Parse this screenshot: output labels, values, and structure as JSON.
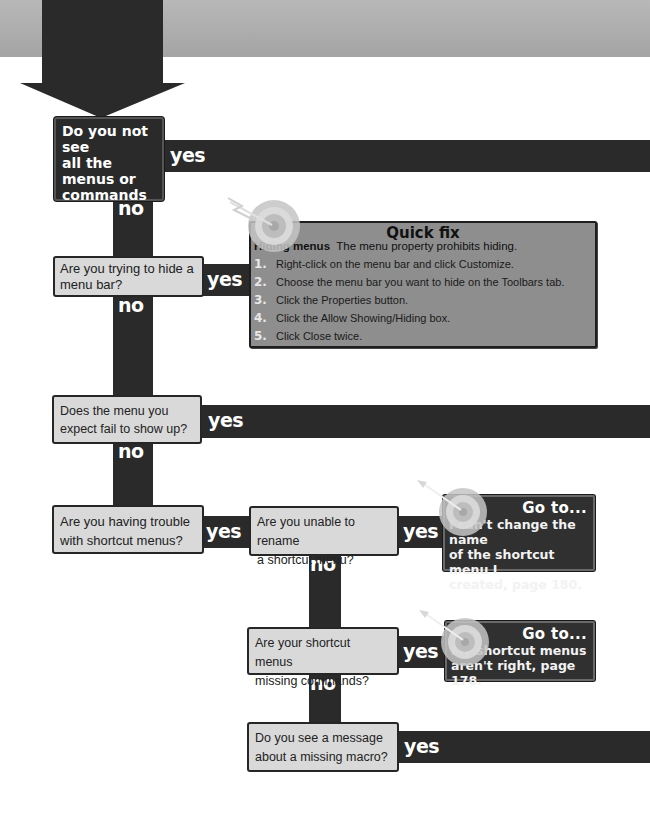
{
  "header": {
    "band_color": "#adadad"
  },
  "colors": {
    "dark": "#2a2a2a",
    "question_box": "#d9d9d9",
    "quick_fix_box": "#8e8e8e",
    "goto_box": "#303030",
    "text_light": "#ffffff"
  },
  "labels": {
    "yes": "yes",
    "no": "no"
  },
  "questions": [
    {
      "id": "q1",
      "text": "Do you not see all the menus or commands you need?",
      "lines": [
        "Do you not see",
        "all the menus or",
        "commands you",
        "need?"
      ],
      "style": "dark"
    },
    {
      "id": "q2",
      "text": "Are you trying to hide a menu bar?",
      "lines": [
        "Are you trying to hide a",
        "menu bar?"
      ],
      "style": "light"
    },
    {
      "id": "q3",
      "text": "Does the menu you expect fail to show up?",
      "lines": [
        "Does the menu you",
        "expect fail to show up?"
      ],
      "style": "light"
    },
    {
      "id": "q4",
      "text": "Are you having trouble with shortcut menus?",
      "lines": [
        "Are you having trouble",
        "with shortcut menus?"
      ],
      "style": "light"
    },
    {
      "id": "q5",
      "text": "Are you unable to rename a shortcut menu?",
      "lines": [
        "Are you unable to rename",
        "a shortcut menu?"
      ],
      "style": "light"
    },
    {
      "id": "q6",
      "text": "Are your shortcut menus missing commands?",
      "lines": [
        "Are your shortcut menus",
        "missing commands?"
      ],
      "style": "light"
    },
    {
      "id": "q7",
      "text": "Do you see a message about a missing macro?",
      "lines": [
        "Do you see a message",
        "about a missing macro?"
      ],
      "style": "light"
    }
  ],
  "quick_fix": {
    "title": "Quick fix",
    "subtitle_bold": "Hiding menus",
    "subtitle": "The menu property prohibits hiding.",
    "steps": [
      {
        "num": "1.",
        "text": "Right-click on the menu bar and click Customize."
      },
      {
        "num": "2.",
        "text": "Choose the menu bar you want to hide on the Toolbars tab."
      },
      {
        "num": "3.",
        "text": "Click the Properties button."
      },
      {
        "num": "4.",
        "text": "Click the Allow Showing/Hiding box."
      },
      {
        "num": "5.",
        "text": "Click Close twice."
      }
    ]
  },
  "goto": [
    {
      "title": "Go to...",
      "lines": [
        "I can't change the name",
        "of the shortcut menu I",
        "created, page 180."
      ],
      "page": "180"
    },
    {
      "title": "Go to...",
      "lines": [
        "My shortcut menus",
        "aren't right, page 178."
      ],
      "page": "178"
    }
  ],
  "icons": {
    "target": "target-with-arrow-icon",
    "start_arrow": "down-arrow-icon"
  }
}
